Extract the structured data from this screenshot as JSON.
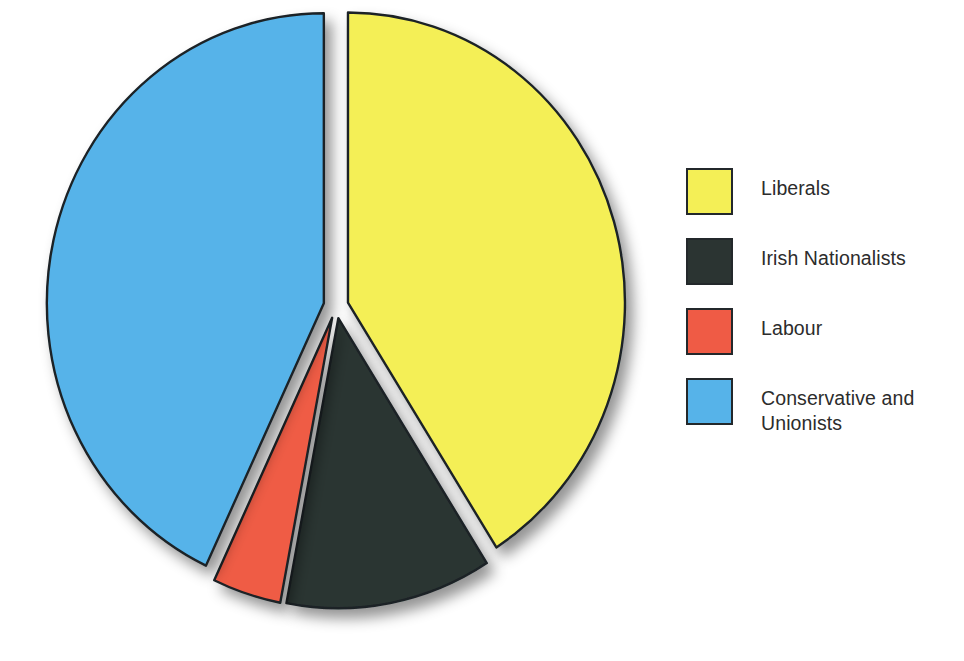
{
  "chart_data": {
    "type": "pie",
    "title": "",
    "subtitle": "",
    "xlabel": "",
    "ylabel": "",
    "legend_position": "right",
    "exploded": true,
    "grid": false,
    "categories": [
      "Liberals",
      "Irish Nationalists",
      "Labour",
      "Conservative and Unionists"
    ],
    "values": [
      41,
      12,
      4,
      43
    ],
    "slices": [
      {
        "label": "Liberals",
        "value": 41,
        "color": "#f4ef56",
        "start_angle_deg": 0,
        "end_angle_deg": 147.6,
        "explode": 0.045
      },
      {
        "label": "Irish Nationalists",
        "value": 12,
        "color": "#2b3432",
        "start_angle_deg": 147.6,
        "end_angle_deg": 190.8,
        "explode": 0.045
      },
      {
        "label": "Labour",
        "value": 4,
        "color": "#ef5b45",
        "start_angle_deg": 190.8,
        "end_angle_deg": 205.2,
        "explode": 0.045
      },
      {
        "label": "Conservative and Unionists",
        "value": 43,
        "color": "#56b3e9",
        "start_angle_deg": 205.2,
        "end_angle_deg": 360,
        "explode": 0.045
      }
    ],
    "geometry": {
      "center_x": 336,
      "center_y": 306,
      "radius_x": 277,
      "radius_y": 290,
      "stroke_color": "#1b2226",
      "stroke_width": 2.4,
      "background": "#ffffff"
    }
  },
  "legend": {
    "items": [
      {
        "label": "Liberals",
        "color": "#f4ef56",
        "swatch_name": "legend-swatch-liberals"
      },
      {
        "label": "Irish Nationalists",
        "color": "#2b3432",
        "swatch_name": "legend-swatch-irish-nationalists"
      },
      {
        "label": "Labour",
        "color": "#ef5b45",
        "swatch_name": "legend-swatch-labour"
      },
      {
        "label": "Conservative and\nUnionists",
        "color": "#56b3e9",
        "swatch_name": "legend-swatch-conservative-and-unionists"
      }
    ]
  }
}
